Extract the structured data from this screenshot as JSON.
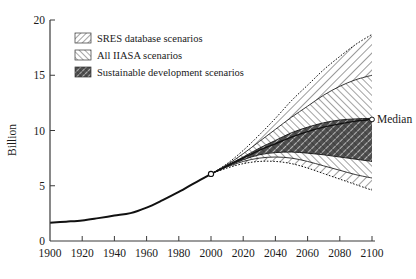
{
  "figure": {
    "background_color": "#ffffff",
    "axis_color": "#3a3a3a",
    "line_color": "#111111"
  },
  "chart_data": {
    "type": "area",
    "title": "",
    "xlabel": "",
    "ylabel": "Billion",
    "xlim": [
      1900,
      2100
    ],
    "ylim": [
      0,
      20
    ],
    "grid": false,
    "legend_position": "top-left",
    "x_ticks": [
      1900,
      1920,
      1940,
      1960,
      1980,
      2000,
      2020,
      2040,
      2060,
      2080,
      2100
    ],
    "x_tick_labels": [
      "1900",
      "1920",
      "1940",
      "1960",
      "1980",
      "2000",
      "2020",
      "2040",
      "2060",
      "2080",
      "2100"
    ],
    "y_ticks": [
      0,
      5,
      10,
      15,
      20
    ],
    "y_tick_labels": [
      "0",
      "5",
      "10",
      "15",
      "20"
    ],
    "annotations": [
      {
        "text": "Median",
        "x": 2100,
        "y": 11.0
      }
    ],
    "series": [
      {
        "name": "Historical population",
        "type": "line",
        "x": [
          1900,
          1910,
          1920,
          1930,
          1940,
          1950,
          1960,
          1970,
          1980,
          1990,
          2000
        ],
        "values": [
          1.65,
          1.75,
          1.86,
          2.07,
          2.3,
          2.52,
          3.02,
          3.7,
          4.44,
          5.27,
          6.07
        ]
      },
      {
        "name": "SRES database scenarios",
        "type": "band",
        "x": [
          2000,
          2010,
          2020,
          2030,
          2040,
          2050,
          2060,
          2070,
          2080,
          2090,
          2100
        ],
        "upper": [
          6.07,
          7.0,
          8.2,
          9.6,
          11.1,
          12.7,
          14.1,
          15.5,
          16.7,
          17.8,
          18.7
        ],
        "lower": [
          6.07,
          6.6,
          7.0,
          7.2,
          7.2,
          7.0,
          6.6,
          6.1,
          5.6,
          5.1,
          4.6
        ]
      },
      {
        "name": "All IIASA scenarios",
        "type": "band",
        "x": [
          2000,
          2010,
          2020,
          2030,
          2040,
          2050,
          2060,
          2070,
          2080,
          2090,
          2100
        ],
        "upper": [
          6.07,
          6.9,
          7.9,
          9.0,
          10.1,
          11.2,
          12.2,
          13.2,
          14.0,
          14.6,
          15.0
        ],
        "lower": [
          6.07,
          6.7,
          7.2,
          7.5,
          7.6,
          7.5,
          7.2,
          6.8,
          6.4,
          6.0,
          5.7
        ]
      },
      {
        "name": "Sustainable development scenarios",
        "type": "band",
        "x": [
          2000,
          2010,
          2020,
          2030,
          2040,
          2050,
          2060,
          2070,
          2080,
          2090,
          2100
        ],
        "upper": [
          6.07,
          6.85,
          7.6,
          8.4,
          9.1,
          9.8,
          10.3,
          10.7,
          10.95,
          11.05,
          11.1
        ],
        "lower": [
          6.07,
          6.75,
          7.35,
          7.8,
          8.0,
          8.05,
          7.95,
          7.8,
          7.6,
          7.4,
          7.2
        ]
      },
      {
        "name": "Median",
        "type": "line",
        "x": [
          2000,
          2010,
          2020,
          2030,
          2040,
          2050,
          2060,
          2070,
          2080,
          2090,
          2100
        ],
        "values": [
          6.07,
          6.8,
          7.5,
          8.2,
          8.8,
          9.4,
          9.9,
          10.3,
          10.6,
          10.85,
          11.0
        ]
      }
    ]
  },
  "legend": {
    "items": [
      {
        "label": "SRES database scenarios",
        "pattern": "diagonal-hatch-light",
        "swatch_name": "legend-swatch-sres"
      },
      {
        "label": "All IIASA scenarios",
        "pattern": "diagonal-hatch-medium",
        "swatch_name": "legend-swatch-iiasa"
      },
      {
        "label": "Sustainable development scenarios",
        "pattern": "cross-hatch-dark",
        "swatch_name": "legend-swatch-sustainable"
      }
    ]
  }
}
